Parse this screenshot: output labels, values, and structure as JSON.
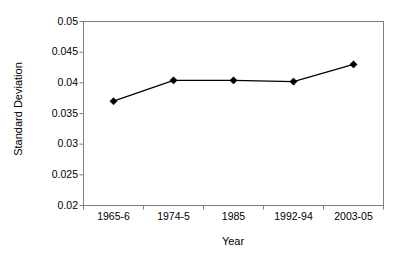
{
  "chart_data": {
    "type": "line",
    "title": "",
    "xlabel": "Year",
    "ylabel": "Standard Deviation",
    "categories": [
      "1965-6",
      "1974-5",
      "1985",
      "1992-94",
      "2003-05"
    ],
    "values": [
      0.037,
      0.0404,
      0.0404,
      0.0402,
      0.043
    ],
    "series": [
      {
        "name": "Standard Deviation",
        "values": [
          0.037,
          0.0404,
          0.0404,
          0.0402,
          0.043
        ]
      }
    ],
    "ylim": [
      0.02,
      0.05
    ],
    "ytick_values": [
      0.02,
      0.025,
      0.03,
      0.035,
      0.04,
      0.045,
      0.05
    ],
    "ytick_labels": [
      "0.02",
      "0.025",
      "0.03",
      "0.035",
      "0.04",
      "0.045",
      "0.05"
    ],
    "grid": false,
    "legend": false,
    "marker": "diamond",
    "line_color": "#000000",
    "marker_color": "#000000",
    "axis_color": "#808080",
    "plot_background": "#ffffff"
  }
}
